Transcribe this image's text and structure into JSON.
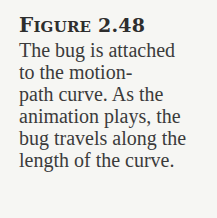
{
  "figure": {
    "label_initial": "F",
    "label_rest": "IGURE",
    "number": "2.48"
  },
  "caption_lines": [
    "The bug is attached",
    "to the motion-",
    "path curve. As the",
    "animation plays, the",
    "bug travels along the",
    "length of the curve."
  ]
}
